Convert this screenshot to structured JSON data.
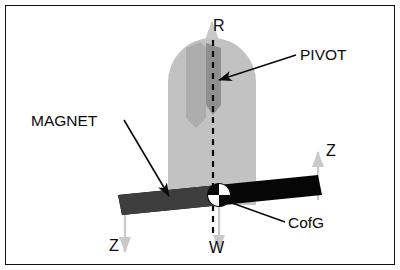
{
  "diagram": {
    "background_color": "#ffffff",
    "border_color": "#111111",
    "labels": {
      "pivot": "PIVOT",
      "magnet": "MAGNET",
      "cofg": "CofG",
      "reaction": "R",
      "weight": "W",
      "z_right": "Z",
      "z_left": "Z"
    },
    "colors": {
      "pendulum_body": "#c2c2c2",
      "pendulum_slot": "#9a9a9a",
      "magnet_left": "#3e3e3e",
      "magnet_right": "#060606",
      "force_arrow": "#c9c9c9",
      "leader_line": "#0b0b0b",
      "centerline": "#0a0a0a"
    },
    "elements": {
      "pendulum_name": "rounded-arch-pendulum-body",
      "slot_name": "pivot-slot",
      "centerline_name": "vertical-dashed-centre-line",
      "magnet_bar_name": "tilted-magnet-bar",
      "cofg_symbol_name": "centre-of-gravity-quadrant-symbol"
    },
    "forces": [
      {
        "symbol": "R",
        "direction": "up",
        "at": "pivot-top"
      },
      {
        "symbol": "W",
        "direction": "down",
        "at": "centre-of-gravity"
      },
      {
        "symbol": "Z",
        "direction": "up",
        "at": "magnet-right-end"
      },
      {
        "symbol": "Z",
        "direction": "down",
        "at": "magnet-left-end"
      }
    ]
  }
}
